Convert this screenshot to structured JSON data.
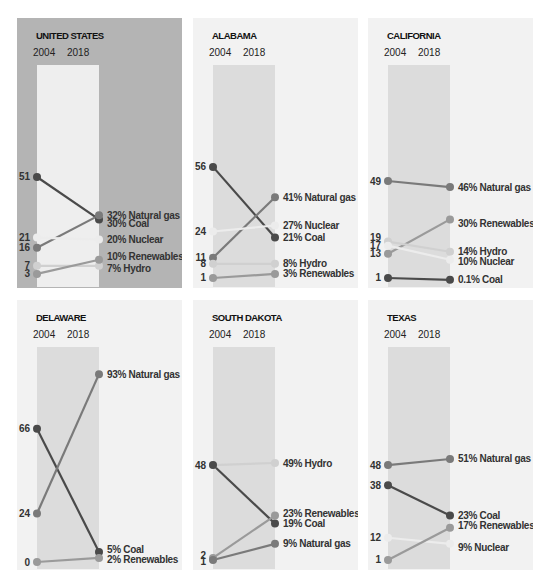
{
  "colors": {
    "coal": "#4a4a4a",
    "natural_gas": "#7a7a7a",
    "nuclear": "#ececec",
    "renewables": "#9a9a9a",
    "hydro": "#d0d0d0",
    "highlight_panel_bg": "#b4b4b4",
    "panel_bg": "#f2f2f2",
    "band_bg_highlight": "#eeeeee",
    "band_bg": "#dcdcdc"
  },
  "chart_data": [
    {
      "type": "line",
      "title": "UNITED STATES",
      "highlight": true,
      "x": [
        "2004",
        "2018"
      ],
      "ylim": [
        0,
        100
      ],
      "series": [
        {
          "name": "Coal",
          "key": "coal",
          "values": [
            51,
            30
          ],
          "label_2004": "51",
          "label_2018": "30% Coal"
        },
        {
          "name": "Natural gas",
          "key": "natural_gas",
          "values": [
            16,
            32
          ],
          "label_2004": "16",
          "label_2018": "32% Natural gas"
        },
        {
          "name": "Nuclear",
          "key": "nuclear",
          "values": [
            21,
            20
          ],
          "label_2004": "21",
          "label_2018": "20% Nuclear"
        },
        {
          "name": "Hydro",
          "key": "hydro",
          "values": [
            7,
            7
          ],
          "label_2004": "7",
          "label_2018": "7% Hydro"
        },
        {
          "name": "Renewables",
          "key": "renewables",
          "values": [
            3,
            10
          ],
          "label_2004": "3",
          "label_2018": "10% Renewables"
        }
      ]
    },
    {
      "type": "line",
      "title": "ALABAMA",
      "highlight": false,
      "x": [
        "2004",
        "2018"
      ],
      "ylim": [
        0,
        100
      ],
      "series": [
        {
          "name": "Coal",
          "key": "coal",
          "values": [
            56,
            21
          ],
          "label_2004": "56",
          "label_2018": "21% Coal"
        },
        {
          "name": "Natural gas",
          "key": "natural_gas",
          "values": [
            11,
            41
          ],
          "label_2004": "11",
          "label_2018": "41% Natural gas"
        },
        {
          "name": "Nuclear",
          "key": "nuclear",
          "values": [
            24,
            27
          ],
          "label_2004": "24",
          "label_2018": "27% Nuclear"
        },
        {
          "name": "Hydro",
          "key": "hydro",
          "values": [
            8,
            8
          ],
          "label_2004": "8",
          "label_2018": "8% Hydro"
        },
        {
          "name": "Renewables",
          "key": "renewables",
          "values": [
            1,
            3
          ],
          "label_2004": "1",
          "label_2018": "3% Renewables"
        }
      ]
    },
    {
      "type": "line",
      "title": "CALIFORNIA",
      "highlight": false,
      "x": [
        "2004",
        "2018"
      ],
      "ylim": [
        0,
        100
      ],
      "series": [
        {
          "name": "Natural gas",
          "key": "natural_gas",
          "values": [
            49,
            46
          ],
          "label_2004": "49",
          "label_2018": "46% Natural gas"
        },
        {
          "name": "Renewables",
          "key": "renewables",
          "values": [
            13,
            30
          ],
          "label_2004": "13",
          "label_2018": "30% Renewables"
        },
        {
          "name": "Hydro",
          "key": "hydro",
          "values": [
            19,
            14
          ],
          "label_2004": "19",
          "label_2018": "14% Hydro"
        },
        {
          "name": "Nuclear",
          "key": "nuclear",
          "values": [
            17,
            10
          ],
          "label_2004": "17",
          "label_2018": "10% Nuclear"
        },
        {
          "name": "Coal",
          "key": "coal",
          "values": [
            1,
            0.1
          ],
          "label_2004": "1",
          "label_2018": "0.1% Coal"
        }
      ]
    },
    {
      "type": "line",
      "title": "DELAWARE",
      "highlight": false,
      "x": [
        "2004",
        "2018"
      ],
      "ylim": [
        0,
        100
      ],
      "series": [
        {
          "name": "Coal",
          "key": "coal",
          "values": [
            66,
            5
          ],
          "label_2004": "66",
          "label_2018": "5% Coal"
        },
        {
          "name": "Natural gas",
          "key": "natural_gas",
          "values": [
            24,
            93
          ],
          "label_2004": "24",
          "label_2018": "93% Natural gas"
        },
        {
          "name": "Renewables",
          "key": "renewables",
          "values": [
            0,
            2
          ],
          "label_2004": "0",
          "label_2018": "2% Renewables"
        }
      ]
    },
    {
      "type": "line",
      "title": "SOUTH DAKOTA",
      "highlight": false,
      "x": [
        "2004",
        "2018"
      ],
      "ylim": [
        0,
        100
      ],
      "series": [
        {
          "name": "Hydro",
          "key": "hydro",
          "values": [
            48,
            49
          ],
          "label_2004": "48",
          "label_2018": "49% Hydro"
        },
        {
          "name": "Coal",
          "key": "coal",
          "values": [
            48,
            19
          ],
          "label_2004": "",
          "label_2018": "19% Coal"
        },
        {
          "name": "Renewables",
          "key": "renewables",
          "values": [
            2,
            23
          ],
          "label_2004": "2",
          "label_2018": "23% Renewables"
        },
        {
          "name": "Natural gas",
          "key": "natural_gas",
          "values": [
            1,
            9
          ],
          "label_2004": "1",
          "label_2018": "9% Natural gas"
        }
      ]
    },
    {
      "type": "line",
      "title": "TEXAS",
      "highlight": false,
      "x": [
        "2004",
        "2018"
      ],
      "ylim": [
        0,
        100
      ],
      "series": [
        {
          "name": "Natural gas",
          "key": "natural_gas",
          "values": [
            48,
            51
          ],
          "label_2004": "48",
          "label_2018": "51% Natural gas"
        },
        {
          "name": "Coal",
          "key": "coal",
          "values": [
            38,
            23
          ],
          "label_2004": "38",
          "label_2018": "23% Coal"
        },
        {
          "name": "Nuclear",
          "key": "nuclear",
          "values": [
            12,
            9
          ],
          "label_2004": "12",
          "label_2018": "9% Nuclear"
        },
        {
          "name": "Renewables",
          "key": "renewables",
          "values": [
            1,
            17
          ],
          "label_2004": "1",
          "label_2018": "17% Renewables"
        }
      ]
    }
  ]
}
